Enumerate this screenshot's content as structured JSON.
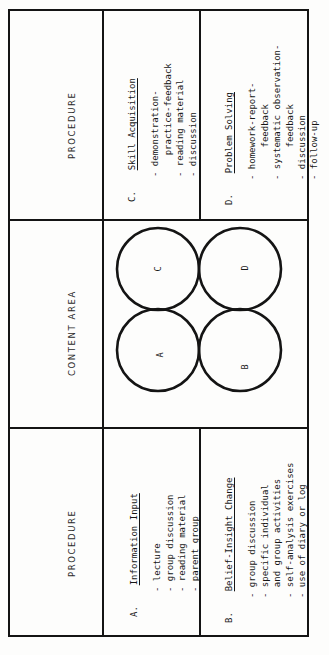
{
  "figure": {
    "type": "table-with-venn-diagram",
    "orientation": "rotated-90-ccw"
  },
  "columns": {
    "procedure_left_header": "PROCEDURE",
    "content_area_header": "CONTENT AREA",
    "procedure_right_header": "PROCEDURE"
  },
  "procedures": [
    {
      "key": "A.",
      "title": "Information Input",
      "items": [
        "- lecture",
        "- group discussion",
        "- reading material",
        "- parent group"
      ]
    },
    {
      "key": "B.",
      "title": "Belief-Insight Change",
      "items": [
        "- group discussion",
        "- specific individual",
        "  and group activities",
        "- self-analysis exercises",
        "- use of diary or log"
      ]
    },
    {
      "key": "C.",
      "title": "Skill Acquisition",
      "items": [
        "- demonstration-",
        "    practice-feedback",
        "- reading material",
        "- discussion"
      ]
    },
    {
      "key": "D.",
      "title": "Problem Solving",
      "items": [
        "- homework-report-",
        "      feedback",
        "- systematic observation-",
        "      feedback",
        "- discussion",
        "- follow-up"
      ]
    }
  ],
  "venn": {
    "circles": [
      {
        "label": "C",
        "cx": 56,
        "cy": 50,
        "r": 41
      },
      {
        "label": "D",
        "cx": 138,
        "cy": 50,
        "r": 41
      },
      {
        "label": "A",
        "cx": 56,
        "cy": 131,
        "r": 41
      },
      {
        "label": "B",
        "cx": 138,
        "cy": 131,
        "r": 41
      }
    ],
    "labels": {
      "a": "A",
      "b": "B",
      "c": "C",
      "d": "D"
    }
  },
  "colors": {
    "ink": "#141414",
    "paper": "#fdfdfc"
  }
}
